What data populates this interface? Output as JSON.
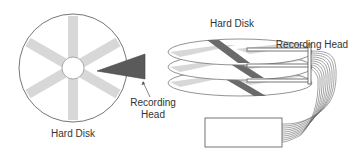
{
  "diagram": {
    "left": {
      "disk_label": "Hard Disk",
      "head_label_line1": "Recording",
      "head_label_line2": "Head"
    },
    "right": {
      "disk_label": "Hard Disk",
      "head_label": "Recording Head",
      "platter_count": 3
    },
    "colors": {
      "stroke": "#555555",
      "hatch": "#999999",
      "head_fill": "#555555",
      "dark_band": "#666666",
      "text": "#333333"
    }
  }
}
